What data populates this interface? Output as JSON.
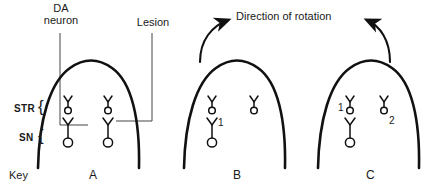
{
  "figure": {
    "title_visible": false,
    "background_color": "#ffffff",
    "ink_color": "#1a1a1a"
  },
  "annotations": {
    "da_neuron_label_line1": "DA",
    "da_neuron_label_line2": "neuron",
    "lesion_label": "Lesion",
    "direction_label": "Direction of rotation",
    "key_label": "Key"
  },
  "regions": {
    "str_label": "STR",
    "sn_label": "SN",
    "brace_glyph": "{"
  },
  "panels": [
    {
      "id": "A",
      "label": "A",
      "neuron_numbers": [],
      "has_rotation_arrows": false,
      "has_lesion": true
    },
    {
      "id": "B",
      "label": "B",
      "neuron_numbers": [
        "1"
      ],
      "has_rotation_arrows": true,
      "has_lesion": false
    },
    {
      "id": "C",
      "label": "C",
      "neuron_numbers": [
        "1",
        "2"
      ],
      "has_rotation_arrows": true,
      "has_lesion": false
    }
  ],
  "icons": {
    "neuron_small": "small-neuron-icon",
    "neuron_large": "large-neuron-icon",
    "arrow_left": "curved-arrow-up-right-icon",
    "arrow_right": "curved-arrow-up-left-icon",
    "brain_outline": "brain-dome-outline-icon"
  }
}
